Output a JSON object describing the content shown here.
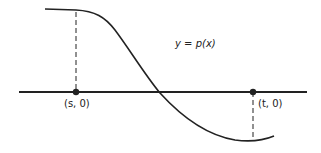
{
  "diagram": {
    "curve_label": "y = p(x)",
    "points": [
      {
        "label": "(s, 0)",
        "name": "s"
      },
      {
        "label": "(t, 0)",
        "name": "t"
      }
    ],
    "colors": {
      "stroke": "#222222",
      "background": "#ffffff"
    }
  }
}
